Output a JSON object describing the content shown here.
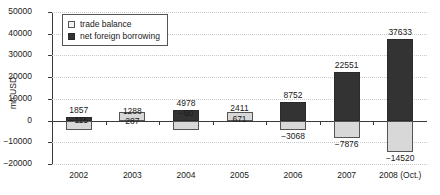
{
  "chart_data": {
    "type": "bar",
    "title": "",
    "xlabel": "",
    "ylabel": "mn USD",
    "ylim": [
      -20000,
      50000
    ],
    "ytick_values": [
      50000,
      40000,
      30000,
      20000,
      10000,
      0,
      -10000,
      -20000
    ],
    "ytick_labels": [
      "50000",
      "40000",
      "30000",
      "20000",
      "10000",
      "0",
      "−10000",
      "−20000"
    ],
    "grid": true,
    "legend_position": "top-left",
    "categories": [
      "2002",
      "2003",
      "2004",
      "2005",
      "2006",
      "2007",
      "2008 (Oct.)"
    ],
    "series": [
      {
        "name": "trade balance",
        "color": "#d8d8d8",
        "values": [
          -115,
          287,
          -60,
          671,
          -3068,
          -7876,
          -14520
        ],
        "value_labels": [
          "−115",
          "287",
          "−60",
          "671",
          "−3068",
          "−7876",
          "−14520"
        ]
      },
      {
        "name": "net foreign borrowing",
        "color": "#333333",
        "values": [
          1857,
          1288,
          4978,
          2411,
          8752,
          22551,
          37633
        ],
        "value_labels": [
          "1857",
          "1288",
          "4978",
          "2411",
          "8752",
          "22551",
          "37633"
        ]
      }
    ]
  },
  "legend": {
    "items": [
      {
        "label": "trade balance",
        "swatch": "light"
      },
      {
        "label": "net foreign borrowing",
        "swatch": "dark"
      }
    ]
  }
}
